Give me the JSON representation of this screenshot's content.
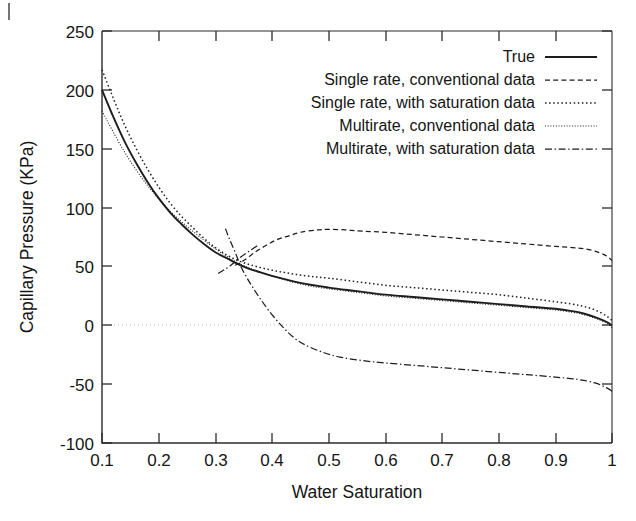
{
  "chart_data": {
    "type": "line",
    "title": "",
    "xlabel": "Water Saturation",
    "ylabel": "Capillary Pressure (KPa)",
    "xlim": [
      0.1,
      1.0
    ],
    "ylim": [
      -100,
      250
    ],
    "xticks": [
      "0.1",
      "0.2",
      "0.3",
      "0.4",
      "0.5",
      "0.6",
      "0.7",
      "0.8",
      "0.9",
      "1"
    ],
    "yticks": [
      "250",
      "200",
      "150",
      "100",
      "50",
      "0",
      "-50",
      "-100"
    ],
    "grid": "zero-line-only",
    "legend_position": "top-right",
    "series": [
      {
        "name": "True",
        "style": "solid",
        "x": [
          0.1,
          0.12,
          0.14,
          0.16,
          0.18,
          0.2,
          0.22,
          0.24,
          0.26,
          0.28,
          0.3,
          0.32,
          0.34,
          0.36,
          0.38,
          0.4,
          0.45,
          0.5,
          0.55,
          0.6,
          0.65,
          0.7,
          0.75,
          0.8,
          0.85,
          0.9,
          0.93,
          0.95,
          0.97,
          0.99,
          1.0
        ],
        "y": [
          200,
          177,
          156,
          138,
          122,
          108,
          96,
          86,
          77,
          69,
          62,
          57,
          52,
          48,
          45,
          42,
          36,
          32,
          29,
          26,
          24,
          22,
          20,
          18,
          16,
          14,
          12,
          10,
          7,
          3,
          0
        ]
      },
      {
        "name": "Single rate, conventional data",
        "style": "dashed",
        "x": [
          0.335,
          0.35,
          0.37,
          0.39,
          0.41,
          0.43,
          0.45,
          0.48,
          0.5,
          0.53,
          0.56,
          0.6,
          0.65,
          0.7,
          0.75,
          0.8,
          0.85,
          0.9,
          0.93,
          0.95,
          0.97,
          0.99,
          1.0
        ],
        "y": [
          51,
          55,
          62,
          68,
          73,
          76,
          79,
          81,
          81.5,
          81,
          80,
          79,
          77,
          75,
          73,
          71,
          69,
          67,
          66,
          65,
          63,
          59,
          55
        ]
      },
      {
        "name": "Single rate, with saturation data",
        "style": "dotted",
        "x": [
          0.1,
          0.14,
          0.18,
          0.22,
          0.26,
          0.3,
          0.34,
          0.38,
          0.42,
          0.46,
          0.5,
          0.55,
          0.6,
          0.65,
          0.7,
          0.75,
          0.8,
          0.85,
          0.9,
          0.93,
          0.95,
          0.97,
          0.99,
          1.0
        ],
        "y": [
          217,
          170,
          133,
          104,
          83,
          66,
          55,
          49,
          45,
          42,
          40,
          37,
          34,
          32,
          30,
          28,
          26,
          23,
          20,
          18,
          16,
          13,
          8,
          4
        ]
      },
      {
        "name": "Multirate, conventional data",
        "style": "fine-dotted",
        "x": [
          0.1,
          0.14,
          0.18,
          0.22,
          0.26,
          0.3,
          0.34,
          0.38,
          0.42,
          0.46,
          0.5,
          0.55,
          0.6,
          0.65,
          0.7,
          0.75,
          0.8,
          0.85,
          0.9,
          0.93,
          0.95,
          0.97,
          0.99,
          1.0
        ],
        "y": [
          182,
          147,
          119,
          97,
          80,
          65,
          53,
          45,
          39,
          34,
          31,
          28,
          25,
          23,
          21,
          19,
          17,
          15,
          13,
          11,
          9,
          6,
          2,
          -2
        ]
      },
      {
        "name": "Multirate, with saturation data",
        "style": "dash-dot",
        "x": [
          0.318,
          0.325,
          0.335,
          0.345,
          0.355,
          0.365,
          0.38,
          0.4,
          0.42,
          0.44,
          0.46,
          0.49,
          0.52,
          0.56,
          0.6,
          0.65,
          0.7,
          0.75,
          0.8,
          0.85,
          0.9,
          0.94,
          0.97,
          0.99,
          1.0
        ],
        "y": [
          82,
          73,
          62,
          50,
          41,
          33,
          22,
          9,
          -2,
          -11,
          -17,
          -23,
          -27,
          -30,
          -32,
          -34,
          -36,
          -38,
          -40,
          -42,
          -44,
          -46,
          -49,
          -53,
          -56
        ]
      },
      {
        "name": "Multirate, with saturation data (lower branch)",
        "style": "dash-dot",
        "x": [
          0.305,
          0.315,
          0.325,
          0.335,
          0.345,
          0.36,
          0.375
        ],
        "y": [
          44,
          47,
          50,
          54,
          58,
          63,
          68
        ]
      }
    ],
    "legend_entries": [
      {
        "label": "True",
        "style": "solid"
      },
      {
        "label": "Single rate, conventional data",
        "style": "dashed"
      },
      {
        "label": "Single rate, with saturation data",
        "style": "dotted"
      },
      {
        "label": "Multirate, conventional data",
        "style": "fine-dotted"
      },
      {
        "label": "Multirate, with saturation data",
        "style": "dash-dot"
      }
    ]
  }
}
